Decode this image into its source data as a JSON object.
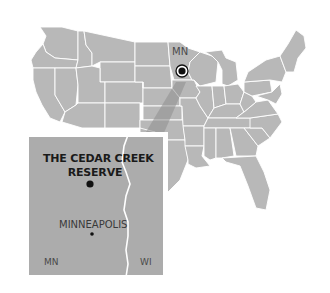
{
  "map": {
    "title": "Cedar Creek Reserve location map",
    "region": "Contiguous United States",
    "colors": {
      "land": "#b8b8b8",
      "inset_land": "#acacac",
      "borders": "#ffffff",
      "marker": "#111111",
      "callout_wedge": "#8e8e8e",
      "background": "#ffffff"
    },
    "locator": {
      "state_label": "MN",
      "marker_icon": "target-marker-icon"
    },
    "inset": {
      "site_label_line1": "THE CEDAR CREEK",
      "site_label_line2": "RESERVE",
      "city_label": "MINNEAPOLIS",
      "left_state": "MN",
      "right_state": "WI"
    }
  }
}
